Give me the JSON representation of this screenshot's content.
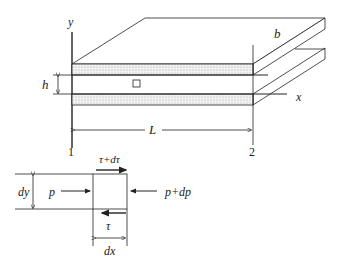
{
  "figure": {
    "axes": {
      "y_label": "y",
      "x_label": "x"
    },
    "plate": {
      "width_label": "b",
      "gap_label": "h",
      "length_label": "L",
      "station_start": "1",
      "station_end": "2"
    },
    "element": {
      "height_label": "dy",
      "width_label": "dx",
      "left_pressure": "p",
      "right_pressure": "p+dp",
      "top_shear": "τ+dτ",
      "bottom_shear": "τ"
    },
    "colors": {
      "line": "#222222",
      "fill_dots": "#bbbbbb",
      "background": "#ffffff"
    }
  }
}
